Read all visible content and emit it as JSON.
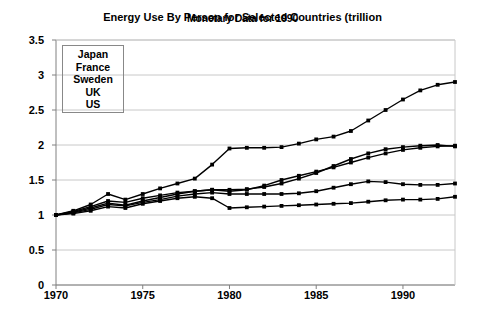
{
  "chart_data": {
    "type": "line",
    "title": "Energy Use By Person for Selected Countries (trillion",
    "title_overlap": "Monetary Data for 1990",
    "xlabel": "",
    "ylabel": "",
    "xlim": [
      1970,
      1993
    ],
    "ylim": [
      0,
      3.5
    ],
    "yticks": [
      "0",
      "0.5",
      "1",
      "1.5",
      "2",
      "2.5",
      "3",
      "3.5"
    ],
    "ytick_values": [
      0,
      0.5,
      1,
      1.5,
      2,
      2.5,
      3,
      3.5
    ],
    "xticks": [
      "1970",
      "1975",
      "1980",
      "1985",
      "1990"
    ],
    "xtick_values": [
      1970,
      1975,
      1980,
      1985,
      1990
    ],
    "grid": true,
    "legend_position": "upper-left-inside",
    "markers": "square",
    "line_color": "#000000",
    "grid_color": "#c8c8c8",
    "axis_color": "#808080",
    "x": [
      1970,
      1971,
      1972,
      1973,
      1974,
      1975,
      1976,
      1977,
      1978,
      1979,
      1980,
      1981,
      1982,
      1983,
      1984,
      1985,
      1986,
      1987,
      1988,
      1989,
      1990,
      1991,
      1992,
      1993
    ],
    "series": [
      {
        "name": "Japan",
        "values": [
          1.0,
          1.06,
          1.15,
          1.3,
          1.22,
          1.3,
          1.38,
          1.45,
          1.52,
          1.72,
          1.95,
          1.96,
          1.96,
          1.97,
          2.02,
          2.08,
          2.12,
          2.2,
          2.35,
          2.5,
          2.65,
          2.78,
          2.86,
          2.9
        ]
      },
      {
        "name": "France",
        "values": [
          1.0,
          1.04,
          1.1,
          1.17,
          1.14,
          1.2,
          1.25,
          1.3,
          1.34,
          1.36,
          1.34,
          1.36,
          1.42,
          1.5,
          1.56,
          1.62,
          1.68,
          1.75,
          1.82,
          1.88,
          1.93,
          1.96,
          1.98,
          1.99
        ]
      },
      {
        "name": "Sweden",
        "values": [
          1.0,
          1.05,
          1.12,
          1.2,
          1.18,
          1.24,
          1.28,
          1.32,
          1.34,
          1.36,
          1.36,
          1.37,
          1.4,
          1.45,
          1.52,
          1.6,
          1.7,
          1.8,
          1.88,
          1.94,
          1.97,
          1.99,
          2.0,
          1.98
        ]
      },
      {
        "name": "UK",
        "values": [
          1.0,
          1.03,
          1.08,
          1.15,
          1.13,
          1.18,
          1.22,
          1.27,
          1.3,
          1.32,
          1.3,
          1.3,
          1.3,
          1.3,
          1.31,
          1.34,
          1.39,
          1.44,
          1.48,
          1.47,
          1.44,
          1.43,
          1.43,
          1.45
        ]
      },
      {
        "name": "US",
        "values": [
          1.0,
          1.02,
          1.06,
          1.12,
          1.1,
          1.16,
          1.2,
          1.24,
          1.26,
          1.24,
          1.1,
          1.11,
          1.12,
          1.13,
          1.14,
          1.15,
          1.16,
          1.17,
          1.19,
          1.21,
          1.22,
          1.22,
          1.23,
          1.26
        ]
      }
    ],
    "legend": [
      "Japan",
      "France",
      "Sweden",
      "UK",
      "US"
    ]
  }
}
